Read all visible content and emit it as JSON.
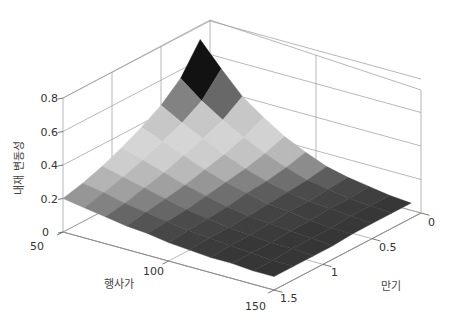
{
  "chart_data": {
    "type": "surface",
    "title": "",
    "xlabel": "행사가",
    "ylabel": "만기",
    "zlabel": "내재 변동성",
    "x_ticks": [
      50,
      100,
      150
    ],
    "y_ticks": [
      0,
      0.5,
      1,
      1.5
    ],
    "z_ticks": [
      0,
      0.2,
      0.4,
      0.6,
      0.8
    ],
    "xlim": [
      50,
      150
    ],
    "ylim": [
      0,
      1.5
    ],
    "zlim": [
      0,
      0.8
    ],
    "grid": true,
    "colormap": "gray (non-monotonic)",
    "x": [
      50,
      60,
      70,
      80,
      90,
      100,
      110,
      120,
      130,
      140,
      150
    ],
    "y": [
      0.1,
      0.3,
      0.5,
      0.7,
      0.9,
      1.1,
      1.3,
      1.5
    ],
    "z": [
      [
        0.72,
        0.58,
        0.45,
        0.36,
        0.28,
        0.22,
        0.17,
        0.14,
        0.12,
        0.1,
        0.09
      ],
      [
        0.55,
        0.45,
        0.37,
        0.3,
        0.24,
        0.19,
        0.15,
        0.13,
        0.11,
        0.1,
        0.09
      ],
      [
        0.45,
        0.38,
        0.32,
        0.26,
        0.21,
        0.17,
        0.14,
        0.12,
        0.11,
        0.1,
        0.09
      ],
      [
        0.38,
        0.33,
        0.28,
        0.23,
        0.19,
        0.16,
        0.13,
        0.12,
        0.1,
        0.09,
        0.09
      ],
      [
        0.32,
        0.28,
        0.24,
        0.2,
        0.17,
        0.14,
        0.12,
        0.11,
        0.1,
        0.09,
        0.08
      ],
      [
        0.27,
        0.24,
        0.21,
        0.18,
        0.15,
        0.13,
        0.11,
        0.1,
        0.09,
        0.09,
        0.08
      ],
      [
        0.23,
        0.21,
        0.18,
        0.16,
        0.14,
        0.12,
        0.11,
        0.1,
        0.09,
        0.08,
        0.08
      ],
      [
        0.2,
        0.18,
        0.16,
        0.14,
        0.13,
        0.11,
        0.1,
        0.09,
        0.09,
        0.08,
        0.08
      ]
    ]
  },
  "axes": {
    "z_label": "내재 변동성",
    "x_label": "행사가",
    "y_label": "만기",
    "z_tick_labels": [
      "0",
      "0.2",
      "0.4",
      "0.6",
      "0.8"
    ],
    "x_tick_labels": [
      "50",
      "100",
      "150"
    ],
    "y_tick_labels": [
      "0",
      "0.5",
      "1",
      "1.5"
    ]
  }
}
